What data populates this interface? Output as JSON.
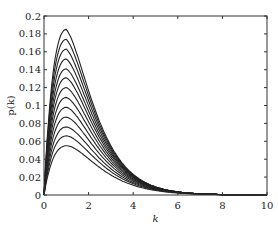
{
  "chart_data": {
    "type": "line",
    "title": "",
    "xlabel": "k",
    "ylabel": "p(k)",
    "xlim": [
      0,
      10
    ],
    "ylim": [
      0,
      0.2
    ],
    "xticks": [
      0,
      2,
      4,
      6,
      8,
      10
    ],
    "yticks": [
      0,
      0.02,
      0.04,
      0.06,
      0.08,
      0.1,
      0.12,
      0.14,
      0.16,
      0.18,
      0.2
    ],
    "grid": false,
    "legend": null,
    "series_count": 13,
    "peak_k": 1.0,
    "peak_values": [
      0.185,
      0.174,
      0.163,
      0.152,
      0.141,
      0.131,
      0.12,
      0.109,
      0.098,
      0.087,
      0.076,
      0.066,
      0.055
    ]
  }
}
